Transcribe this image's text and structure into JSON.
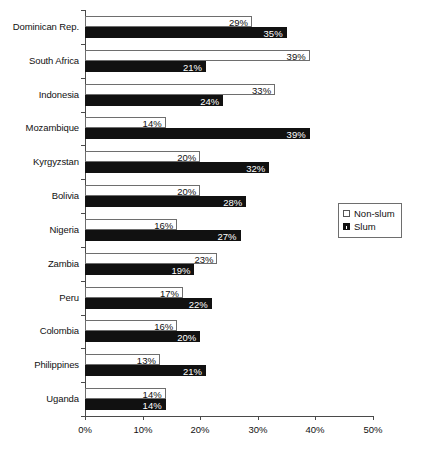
{
  "chart_data": {
    "type": "bar",
    "orientation": "horizontal",
    "title": "",
    "xlabel": "",
    "ylabel": "",
    "xlim": [
      0,
      50
    ],
    "xticks": [
      "0%",
      "10%",
      "20%",
      "30%",
      "40%",
      "50%"
    ],
    "xtick_values": [
      0,
      10,
      20,
      30,
      40,
      50
    ],
    "grid": false,
    "legend_position": "right",
    "value_suffix": "%",
    "categories": [
      "Dominican Rep.",
      "South Africa",
      "Indonesia",
      "Mozambique",
      "Kyrgyzstan",
      "Bolivia",
      "Nigeria",
      "Zambia",
      "Peru",
      "Colombia",
      "Philippines",
      "Uganda"
    ],
    "series": [
      {
        "name": "Non-slum",
        "color": "#ffffff",
        "values": [
          29,
          39,
          33,
          14,
          20,
          20,
          16,
          23,
          17,
          16,
          13,
          14
        ],
        "labels": [
          "29%",
          "39%",
          "33%",
          "14%",
          "20%",
          "20%",
          "16%",
          "23%",
          "17%",
          "16%",
          "13%",
          "14%"
        ]
      },
      {
        "name": "Slum",
        "color": "#111111",
        "values": [
          35,
          21,
          24,
          39,
          32,
          28,
          27,
          19,
          22,
          20,
          21,
          14
        ],
        "labels": [
          "35%",
          "21%",
          "24%",
          "39%",
          "32%",
          "28%",
          "27%",
          "19%",
          "22%",
          "20%",
          "21%",
          "14%"
        ]
      }
    ]
  },
  "legend": {
    "items": [
      {
        "label": "Non-slum",
        "swatch": "open-square-swatch"
      },
      {
        "label": "Slum",
        "swatch": "filled-square-swatch"
      }
    ]
  }
}
